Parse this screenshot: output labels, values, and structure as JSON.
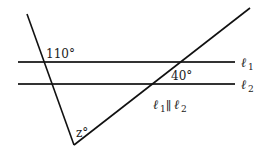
{
  "diagram": {
    "angle_top_left": "110°",
    "angle_right": "40°",
    "angle_bottom": "z°",
    "line1_label": "ℓ",
    "line1_sub": "1",
    "line2_label": "ℓ",
    "line2_sub": "2",
    "parallel_note": {
      "a": "ℓ",
      "a_sub": "1",
      "sym": "∥",
      "b": "ℓ",
      "b_sub": "2"
    },
    "colors": {
      "line": "#222222",
      "background": "#ffffff"
    }
  }
}
